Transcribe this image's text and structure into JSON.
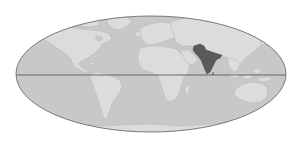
{
  "map": {
    "title": "World map with highlighted region",
    "projection": "elliptical (Mollweide-style)",
    "highlighted_region": "South Asia (Pakistan / India)",
    "colors": {
      "background": "#ffffff",
      "ocean": "#c8c8c8",
      "land": "#dcdcdc",
      "land_outline": "#b4b4b4",
      "highlight": "#5a5a5a",
      "outline": "#6e6e6e",
      "equator": "#5a5a5a"
    },
    "features": [
      {
        "name": "North America",
        "highlighted": false
      },
      {
        "name": "Greenland",
        "highlighted": false
      },
      {
        "name": "South America",
        "highlighted": false
      },
      {
        "name": "Europe",
        "highlighted": false
      },
      {
        "name": "Africa",
        "highlighted": false
      },
      {
        "name": "Madagascar",
        "highlighted": false
      },
      {
        "name": "Asia",
        "highlighted": false
      },
      {
        "name": "South Asia",
        "highlighted": true
      },
      {
        "name": "Southeast Asia / Indonesia",
        "highlighted": false
      },
      {
        "name": "Australia",
        "highlighted": false
      },
      {
        "name": "Antarctica",
        "highlighted": false
      }
    ],
    "equator_line": true
  }
}
